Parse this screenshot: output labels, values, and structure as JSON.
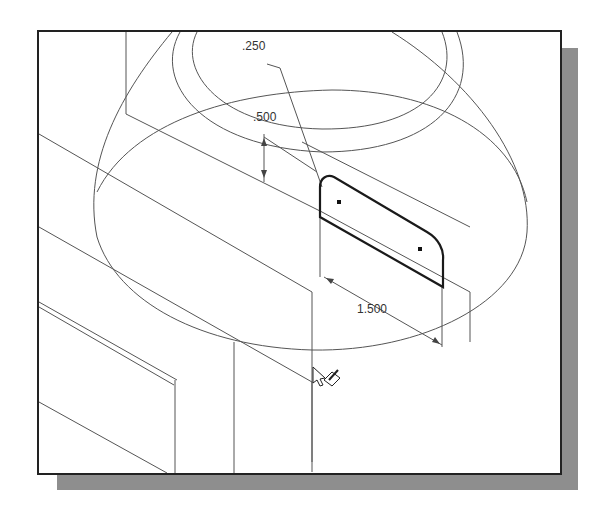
{
  "viewport": {
    "title": "CAD sketch viewport - isometric view",
    "background": "#ffffff",
    "frame_color": "#222222",
    "shadow_color": "#8e8e8e",
    "line_color": "#444444",
    "profile_color": "#222222"
  },
  "dimensions": [
    {
      "id": "dim-radius",
      "label": ".250"
    },
    {
      "id": "dim-height",
      "label": ".500"
    },
    {
      "id": "dim-length",
      "label": "1.500"
    }
  ],
  "cursor": {
    "icon": "pointer-with-pencil-icon"
  }
}
